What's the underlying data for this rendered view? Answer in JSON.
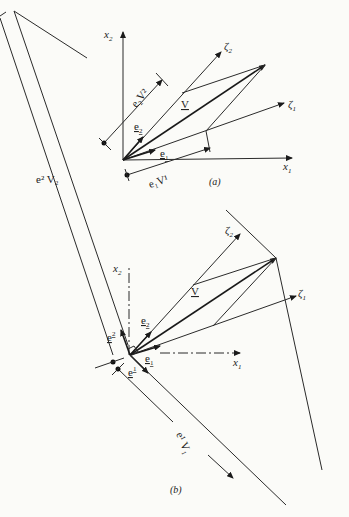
{
  "figure": {
    "panel_a": {
      "caption": "(a)",
      "labels": {
        "x1": "x",
        "x1_sub": "1",
        "x2": "x",
        "x2_sub": "2",
        "zeta1": "ζ",
        "zeta1_sub": "1",
        "zeta2": "ζ",
        "zeta2_sub": "2",
        "V": "V",
        "e1": "e",
        "e1_sub": "1",
        "e2": "e",
        "e2_sub": "2",
        "e1V1": "e₁V¹",
        "e2V2": "e₂V²"
      }
    },
    "panel_b": {
      "caption": "(b)",
      "labels": {
        "x1": "x",
        "x1_sub": "1",
        "x2": "x",
        "x2_sub": "2",
        "zeta1": "ζ",
        "zeta1_sub": "1",
        "zeta2": "ζ",
        "zeta2_sub": "2",
        "V": "V",
        "e1": "e",
        "e1_sub": "1",
        "e2": "e",
        "e2_sub": "2",
        "e_sup1": "e",
        "e_sup1_sup": "1",
        "e_sup2": "e",
        "e_sup2_sup": "2",
        "e2V2": "e² V₂",
        "e1V1": "e¹ V₁"
      }
    }
  }
}
